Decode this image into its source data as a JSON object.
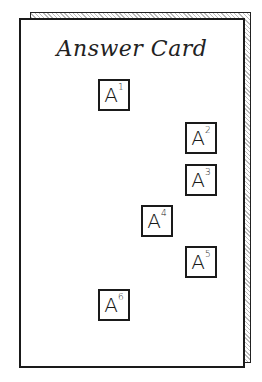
{
  "card": {
    "title": "Answer Card",
    "boxes": [
      {
        "letter": "A",
        "index": "1",
        "x": 77,
        "y": 59
      },
      {
        "letter": "A",
        "index": "2",
        "x": 165,
        "y": 102
      },
      {
        "letter": "A",
        "index": "3",
        "x": 165,
        "y": 144
      },
      {
        "letter": "A",
        "index": "4",
        "x": 121,
        "y": 185
      },
      {
        "letter": "A",
        "index": "5",
        "x": 165,
        "y": 226
      },
      {
        "letter": "A",
        "index": "6",
        "x": 77,
        "y": 269
      }
    ]
  }
}
